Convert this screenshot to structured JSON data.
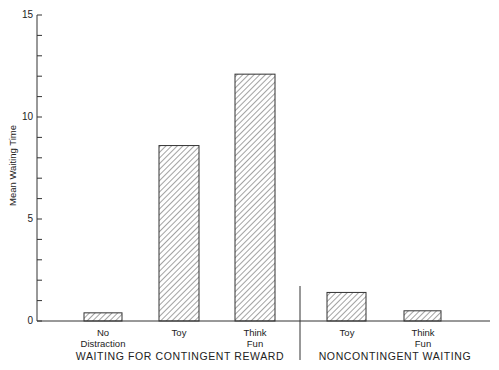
{
  "chart_data": {
    "type": "bar",
    "title": "",
    "xlabel": "",
    "ylabel": "Mean Waiting Time",
    "ylim": [
      0,
      15
    ],
    "yticks": [
      0,
      5,
      10,
      15
    ],
    "minor_tick_step": 1,
    "grid": false,
    "legend": null,
    "bar_fill": "diagonal hatching",
    "groups": [
      {
        "name": "WAITING FOR CONTINGENT REWARD",
        "categories": [
          "No Distraction",
          "Toy",
          "Think Fun"
        ],
        "values": [
          0.4,
          8.6,
          12.1
        ]
      },
      {
        "name": "NONCONTINGENT WAITING",
        "categories": [
          "Toy",
          "Think Fun"
        ],
        "values": [
          1.4,
          0.5
        ]
      }
    ],
    "categories": [
      "No Distraction",
      "Toy",
      "Think Fun",
      "Toy",
      "Think Fun"
    ],
    "values": [
      0.4,
      8.6,
      12.1,
      1.4,
      0.5
    ]
  },
  "axis": {
    "ylabel": "Mean Waiting Time",
    "tick_labels": [
      "0",
      "5",
      "10",
      "15"
    ]
  },
  "labels": {
    "c1_line1": "No",
    "c1_line2": "Distraction",
    "c2_line1": "Toy",
    "c3_line1": "Think",
    "c3_line2": "Fun",
    "c4_line1": "Toy",
    "c5_line1": "Think",
    "c5_line2": "Fun",
    "group1": "WAITING FOR CONTINGENT REWARD",
    "group2": "NONCONTINGENT WAITING"
  }
}
